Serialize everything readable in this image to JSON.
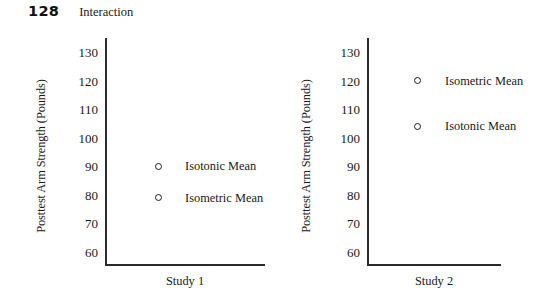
{
  "header": {
    "page_number": "128",
    "running_title": "Interaction"
  },
  "chart_data": [
    {
      "type": "scatter",
      "title": "Study 1",
      "xlabel": "Study 1",
      "ylabel": "Posttest Arm Strength (Pounds)",
      "ylim": [
        55,
        135
      ],
      "yticks": [
        130,
        120,
        110,
        100,
        90,
        80,
        70,
        60
      ],
      "ytick_labels": [
        "130",
        "120",
        "110",
        "100",
        "90",
        "80",
        "70",
        "60"
      ],
      "grid": false,
      "legend": "inline-right-of-point",
      "points": [
        {
          "label": "Isotonic Mean",
          "value": 90,
          "marker": "open-circle"
        },
        {
          "label": "Isometric Mean",
          "value": 79,
          "marker": "open-circle"
        }
      ]
    },
    {
      "type": "scatter",
      "title": "Study 2",
      "xlabel": "Study 2",
      "ylabel": "Posttest Arm Strength (Pounds)",
      "ylim": [
        55,
        135
      ],
      "yticks": [
        130,
        120,
        110,
        100,
        90,
        80,
        70,
        60
      ],
      "ytick_labels": [
        "130",
        "120",
        "110",
        "100",
        "90",
        "80",
        "70",
        "60"
      ],
      "grid": false,
      "legend": "inline-right-of-point",
      "points": [
        {
          "label": "Isometric Mean",
          "value": 120,
          "marker": "open-circle"
        },
        {
          "label": "Isotonic Mean",
          "value": 104,
          "marker": "open-circle"
        }
      ]
    }
  ],
  "colors": {
    "axis": "#2b2b2b",
    "marker": "#1d1d1d",
    "text": "#1a1a1a",
    "background": "#ffffff"
  }
}
